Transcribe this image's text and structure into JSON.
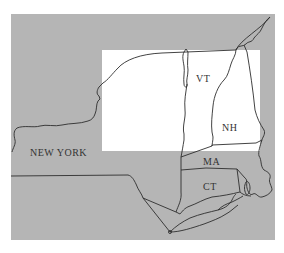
{
  "map": {
    "colors": {
      "background": "#ffffff",
      "land": "#b5b5b5",
      "highlight": "#ffffff",
      "border": "#2e2e2e",
      "label": "#333333"
    },
    "labels": {
      "new_york": "NEW YORK",
      "vermont": "VT",
      "new_hampshire": "NH",
      "massachusetts": "MA",
      "connecticut": "CT"
    }
  }
}
